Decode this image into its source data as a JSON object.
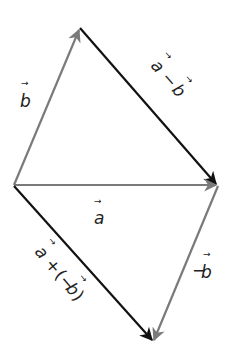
{
  "diagram": {
    "points": {
      "origin": [
        14,
        185
      ],
      "top": [
        80,
        28
      ],
      "right": [
        218,
        185
      ],
      "bottom": [
        153,
        342
      ]
    },
    "vectors": [
      {
        "id": "b",
        "from": "origin",
        "to": "top",
        "color": "#7a7a7a",
        "label": "b"
      },
      {
        "id": "a_minus_b",
        "from": "top",
        "to": "right",
        "color": "#111111",
        "label": "a − b"
      },
      {
        "id": "a",
        "from": "origin",
        "to": "right",
        "color": "#7a7a7a",
        "label": "a"
      },
      {
        "id": "neg_b",
        "from": "right",
        "to": "bottom",
        "color": "#7a7a7a",
        "label": "−b"
      },
      {
        "id": "a_plus_neg_b",
        "from": "origin",
        "to": "bottom",
        "color": "#111111",
        "label": "a + (−b)"
      }
    ],
    "labels": {
      "b": "b",
      "a": "a",
      "neg_b_minus": "−",
      "neg_b_letter": "b",
      "a_minus_b_a": "a",
      "a_minus_b_op": "−",
      "a_minus_b_b": "b",
      "a_plus_neg_b_a": "a",
      "a_plus_neg_b_op": "+",
      "a_plus_neg_b_open": "(−",
      "a_plus_neg_b_b": "b",
      "a_plus_neg_b_close": ")",
      "vector_arrow": "→"
    },
    "colors": {
      "gray": "#7a7a7a",
      "black": "#111111"
    }
  }
}
